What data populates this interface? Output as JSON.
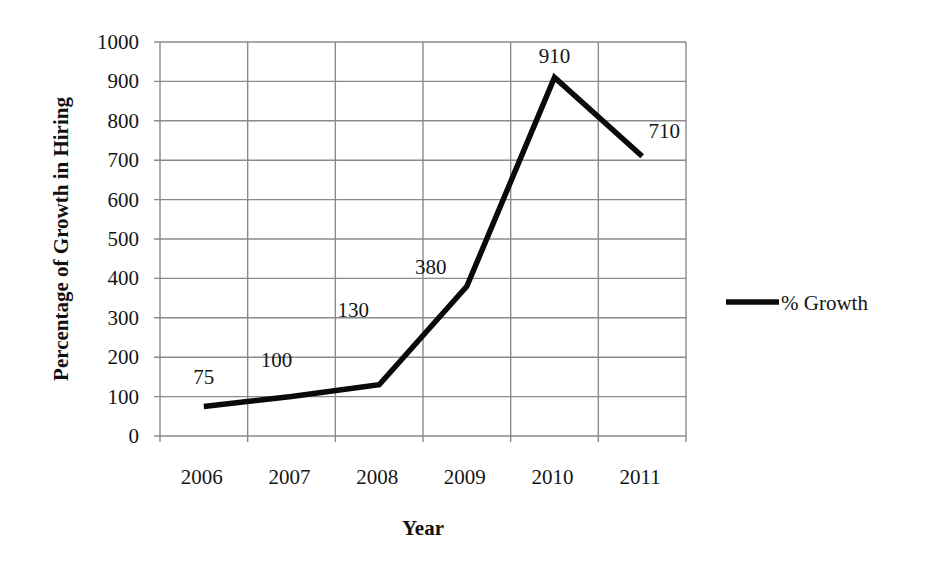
{
  "chart_data": {
    "type": "line",
    "title": "",
    "xlabel": "Year",
    "ylabel": "Percentage of Growth in Hiring",
    "categories": [
      "2006",
      "2007",
      "2008",
      "2009",
      "2010",
      "2011"
    ],
    "series": [
      {
        "name": "% Growth",
        "values": [
          75,
          100,
          130,
          380,
          910,
          710
        ],
        "color": "#0a0a0a"
      }
    ],
    "data_labels": [
      "75",
      "100",
      "130",
      "380",
      "910",
      "710"
    ],
    "yticks": [
      0,
      100,
      200,
      300,
      400,
      500,
      600,
      700,
      800,
      900,
      1000
    ],
    "ylim": [
      0,
      1000
    ],
    "grid": true,
    "legend_position": "right"
  },
  "legend": {
    "label": "% Growth"
  },
  "axes": {
    "x_title": "Year",
    "y_title": "Percentage of Growth in Hiring"
  }
}
